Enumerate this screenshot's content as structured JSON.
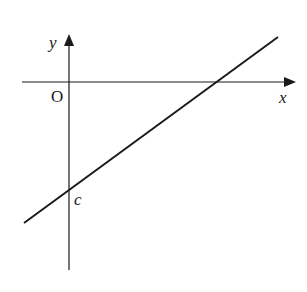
{
  "diagram": {
    "type": "cartesian-line-graph",
    "axes": {
      "x_label": "x",
      "y_label": "y",
      "origin_label": "O"
    },
    "line": {
      "description": "straight line with positive gradient and negative y-intercept",
      "intercept_label": "c"
    },
    "colors": {
      "stroke": "#1a1a1a",
      "background": "#ffffff"
    }
  }
}
